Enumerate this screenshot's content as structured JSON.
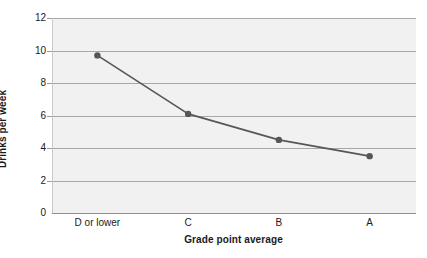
{
  "chart_data": {
    "type": "line",
    "title": "",
    "xlabel": "Grade point average",
    "ylabel": "Drinks per week",
    "categories": [
      "D or lower",
      "C",
      "B",
      "A"
    ],
    "values": [
      9.7,
      6.1,
      4.5,
      3.5
    ],
    "ylim": [
      0,
      12
    ],
    "yticks": [
      0,
      2,
      4,
      6,
      8,
      10,
      12
    ],
    "ytick_labels": [
      "0",
      "2",
      "4",
      "6",
      "8",
      "10",
      "12"
    ],
    "grid": true,
    "legend": "none",
    "series_color": "#565656",
    "marker_color": "#565656",
    "plot_background": "#f1f1f1",
    "gridline_color": "#a8a8a8"
  }
}
